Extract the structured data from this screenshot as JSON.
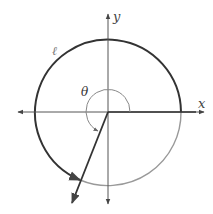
{
  "diagram": {
    "type": "unit-circle-angle",
    "labels": {
      "x_axis": "x",
      "y_axis": "y",
      "angle": "θ",
      "arc": "ℓ"
    },
    "colors": {
      "arc_dark": "#333333",
      "arc_light": "#999999",
      "axis": "#555555",
      "angle_marker": "#888888"
    }
  }
}
